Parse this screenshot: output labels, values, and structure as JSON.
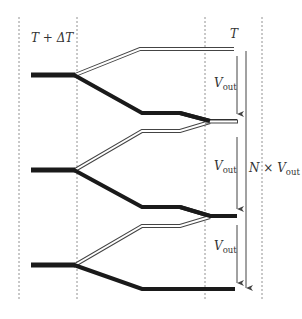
{
  "diagram": {
    "labels": {
      "left_temp": "T + ΔT",
      "right_temp": "T",
      "v_out_1": "V",
      "v_out_2": "V",
      "v_out_3": "V",
      "v_sub": "out",
      "total_n": "N × V",
      "total_sub": "out"
    },
    "colors": {
      "dark_track": "#1a1a1a",
      "light_track_fill": "#ffffff",
      "light_track_edge": "#444444",
      "dashed_line": "#666666",
      "arrow": "#444444"
    },
    "stages": [
      {
        "id": 1,
        "input": "thick black",
        "upper_branch": "hollow/light",
        "lower_branch": "thick black"
      },
      {
        "id": 2,
        "input": "thick black",
        "upper_branch": "hollow/light",
        "lower_branch": "thick black"
      },
      {
        "id": 3,
        "input": "thick black",
        "upper_branch": "hollow/light",
        "lower_branch": "thick black"
      }
    ],
    "outputs": [
      {
        "id": "top",
        "type": "light"
      },
      {
        "id": "junction-1",
        "type": "light"
      },
      {
        "id": "junction-2",
        "type": "dark"
      },
      {
        "id": "bottom",
        "type": "dark"
      }
    ]
  }
}
